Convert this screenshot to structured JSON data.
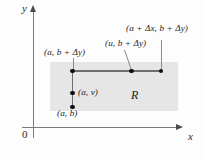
{
  "figure": {
    "axes": {
      "y_label": "y",
      "x_label": "x",
      "origin_label": "0"
    },
    "region": {
      "label": "R",
      "fill_color": "#e6e6e6"
    },
    "points": [
      {
        "name": "corner-top-left",
        "label": "(a, b + Δy)"
      },
      {
        "name": "point-u-top",
        "label": "(u, b + Δy)"
      },
      {
        "name": "corner-top-right",
        "label": "(a + Δx, b + Δy)"
      },
      {
        "name": "point-a-v",
        "label": "(a, v)"
      },
      {
        "name": "corner-bottom-left",
        "label": "(a, b)"
      }
    ],
    "colors": {
      "axis": "#7c7c7c",
      "segment": "#6e6e6e",
      "dot": "#101010",
      "leader": "#8a8a8a",
      "text": "#1c1c1c"
    }
  }
}
